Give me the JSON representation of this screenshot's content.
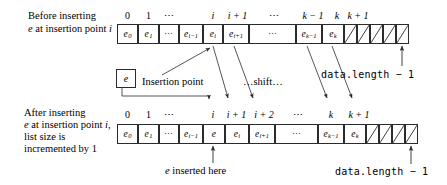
{
  "diagram": {
    "stroke_color": "#2b2b2b",
    "text_color": "#000000"
  },
  "before": {
    "caption_line1": "Before inserting",
    "caption_line2_prefix": "e",
    "caption_line2_rest": " at insertion point ",
    "caption_line2_index": "i",
    "indices": [
      "0",
      "1",
      "⋯",
      "i",
      "i + 1",
      "⋯",
      "k − 1",
      "k",
      "k + 1"
    ],
    "cells": [
      {
        "kind": "value",
        "base": "e",
        "sub": "0"
      },
      {
        "kind": "value",
        "base": "e",
        "sub": "1"
      },
      {
        "kind": "dots",
        "text": "⋯"
      },
      {
        "kind": "value",
        "base": "e",
        "sub": "i−1"
      },
      {
        "kind": "value",
        "base": "e",
        "sub": "i"
      },
      {
        "kind": "value",
        "base": "e",
        "sub": "i+1"
      },
      {
        "kind": "dots",
        "text": "⋯"
      },
      {
        "kind": "value",
        "base": "e",
        "sub": "k−1"
      },
      {
        "kind": "value",
        "base": "e",
        "sub": "k"
      },
      {
        "kind": "empty"
      },
      {
        "kind": "empty"
      },
      {
        "kind": "empty"
      },
      {
        "kind": "empty"
      },
      {
        "kind": "empty"
      }
    ],
    "end_label": "data.length − 1"
  },
  "middle": {
    "element_box_label": "e",
    "insertion_point_label": "Insertion point",
    "shift_label": "…shift…"
  },
  "after": {
    "caption_line1": "After inserting",
    "caption_line2_prefix": "e",
    "caption_line2_rest": " at insertion point ",
    "caption_line2_index": "i,",
    "caption_line3": "list size is",
    "caption_line4": "incremented by 1",
    "indices": [
      "0",
      "1",
      "⋯",
      "i",
      "i + 1",
      "i + 2",
      "⋯",
      "k",
      "k + 1"
    ],
    "cells": [
      {
        "kind": "value",
        "base": "e",
        "sub": "0"
      },
      {
        "kind": "value",
        "base": "e",
        "sub": "1"
      },
      {
        "kind": "dots",
        "text": "⋯"
      },
      {
        "kind": "value",
        "base": "e",
        "sub": "i−1"
      },
      {
        "kind": "value",
        "base": "e",
        "sub": ""
      },
      {
        "kind": "value",
        "base": "e",
        "sub": "i"
      },
      {
        "kind": "value",
        "base": "e",
        "sub": "i+1"
      },
      {
        "kind": "dots",
        "text": "⋯"
      },
      {
        "kind": "value",
        "base": "e",
        "sub": "k−1"
      },
      {
        "kind": "value",
        "base": "e",
        "sub": "k"
      },
      {
        "kind": "empty"
      },
      {
        "kind": "empty"
      },
      {
        "kind": "empty"
      },
      {
        "kind": "empty"
      }
    ],
    "inserted_label_prefix": "e",
    "inserted_label_rest": " inserted here",
    "end_label": "data.length − 1"
  }
}
